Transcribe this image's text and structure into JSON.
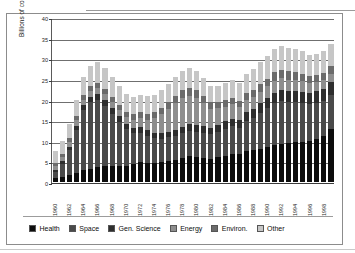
{
  "chart_data": {
    "type": "bar",
    "stacked": true,
    "title": "",
    "xlabel": "",
    "ylabel": "Billions of constant FY 1998 dollars",
    "ylim": [
      0,
      40
    ],
    "yticks": [
      0,
      5,
      10,
      15,
      20,
      25,
      30,
      35,
      40
    ],
    "grid": true,
    "legend_position": "bottom",
    "categories": [
      "1960",
      "1961",
      "1962",
      "1963",
      "1964",
      "1965",
      "1966",
      "1967",
      "1968",
      "1969",
      "1970",
      "1971",
      "1972",
      "1973",
      "1974",
      "1975",
      "1976",
      "1977",
      "1978",
      "1979",
      "1980",
      "1981",
      "1982",
      "1983",
      "1984",
      "1985",
      "1986",
      "1987",
      "1988",
      "1989",
      "1990",
      "1991",
      "1992",
      "1993",
      "1994",
      "1995",
      "1996",
      "1997",
      "1998",
      "1999"
    ],
    "xtick_labels": [
      "1960",
      "1962",
      "1964",
      "1966",
      "1968",
      "1970",
      "1972",
      "1974",
      "1976",
      "1978",
      "1980",
      "1982",
      "1984",
      "1986",
      "1988",
      "1990",
      "1992",
      "1994",
      "1996",
      "1998"
    ],
    "series": [
      {
        "name": "Health",
        "color": "#0d0d0d",
        "values": [
          0.9,
          1.3,
          1.8,
          2.3,
          2.8,
          3.2,
          3.6,
          3.9,
          4.0,
          3.9,
          3.9,
          4.3,
          4.8,
          4.6,
          4.7,
          4.9,
          5.2,
          5.4,
          5.9,
          6.2,
          6.1,
          5.9,
          5.7,
          6.0,
          6.4,
          6.9,
          6.7,
          7.4,
          7.7,
          8.0,
          8.4,
          8.9,
          9.3,
          9.4,
          9.7,
          9.8,
          9.9,
          10.4,
          11.1,
          12.8
        ]
      },
      {
        "name": "Space",
        "color": "#4a4a4a",
        "values": [
          1.5,
          3.1,
          6.0,
          10.4,
          14.6,
          16.2,
          16.3,
          14.6,
          12.5,
          10.7,
          8.9,
          7.6,
          7.2,
          6.6,
          5.9,
          5.6,
          5.6,
          5.8,
          5.9,
          6.1,
          6.0,
          6.0,
          5.9,
          6.2,
          6.5,
          6.6,
          6.5,
          7.4,
          7.9,
          8.8,
          9.6,
          10.3,
          10.4,
          10.0,
          9.6,
          9.4,
          9.0,
          8.8,
          8.6,
          8.4
        ]
      },
      {
        "name": "Gen. Science",
        "color": "#2e2e2e",
        "values": [
          0.5,
          0.6,
          0.8,
          1.0,
          1.2,
          1.3,
          1.4,
          1.4,
          1.4,
          1.3,
          1.3,
          1.3,
          1.3,
          1.3,
          1.3,
          1.3,
          1.4,
          1.5,
          1.6,
          1.7,
          1.7,
          1.6,
          1.6,
          1.7,
          1.8,
          1.9,
          1.9,
          2.1,
          2.2,
          2.3,
          2.4,
          2.5,
          2.6,
          2.6,
          2.7,
          2.7,
          2.7,
          2.8,
          2.9,
          3.0
        ]
      },
      {
        "name": "Energy",
        "color": "#8e8e8e",
        "values": [
          1.0,
          1.1,
          1.2,
          1.3,
          1.4,
          1.4,
          1.4,
          1.4,
          1.5,
          1.6,
          1.7,
          1.9,
          2.2,
          2.6,
          3.6,
          4.6,
          5.5,
          6.4,
          6.9,
          6.8,
          6.5,
          5.6,
          4.6,
          4.0,
          3.6,
          3.4,
          3.1,
          3.0,
          2.9,
          2.8,
          2.8,
          2.9,
          2.9,
          2.8,
          2.7,
          2.5,
          2.3,
          2.2,
          2.1,
          2.1
        ]
      },
      {
        "name": "Environ.",
        "color": "#6b6b6b",
        "values": [
          0.6,
          0.7,
          0.8,
          0.9,
          1.0,
          1.1,
          1.2,
          1.2,
          1.2,
          1.2,
          1.2,
          1.3,
          1.4,
          1.5,
          1.6,
          1.6,
          1.7,
          1.8,
          1.9,
          1.9,
          1.9,
          1.7,
          1.5,
          1.5,
          1.5,
          1.5,
          1.5,
          1.6,
          1.7,
          1.8,
          1.9,
          2.0,
          2.0,
          2.0,
          2.0,
          1.9,
          1.8,
          1.8,
          1.8,
          1.8
        ]
      },
      {
        "name": "Other",
        "color": "#c6c6c6",
        "values": [
          3.0,
          3.2,
          3.5,
          3.9,
          4.5,
          5.0,
          5.3,
          5.1,
          4.8,
          4.5,
          4.3,
          4.2,
          4.3,
          4.2,
          4.1,
          4.2,
          4.4,
          4.6,
          4.8,
          4.9,
          4.8,
          4.4,
          4.0,
          4.0,
          4.2,
          4.4,
          4.3,
          4.7,
          5.0,
          5.3,
          5.5,
          5.7,
          5.8,
          5.7,
          5.6,
          5.4,
          5.2,
          5.1,
          5.2,
          5.3
        ]
      }
    ]
  },
  "legend": {
    "items": [
      {
        "label": "Health"
      },
      {
        "label": "Space"
      },
      {
        "label": "Gen. Science"
      },
      {
        "label": "Energy"
      },
      {
        "label": "Environ."
      },
      {
        "label": "Other"
      }
    ]
  }
}
